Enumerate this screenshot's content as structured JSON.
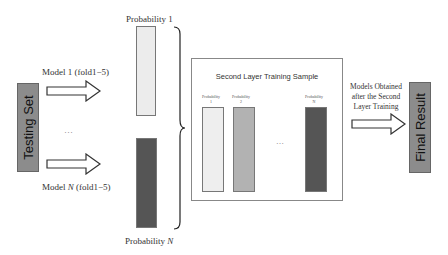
{
  "diagram": {
    "testing_set": {
      "label": "Testing Set",
      "color": "#8c8c8c"
    },
    "model_1": {
      "label": "Model 1 (fold1−5)"
    },
    "model_n": {
      "label_prefix": "Model ",
      "label_var": "N",
      "label_suffix": " (fold1−5)"
    },
    "ellipsis_models": "…",
    "probability_1": {
      "label": "Probability 1",
      "color": "#ececec"
    },
    "probability_n": {
      "label_prefix": "Probability ",
      "label_var": "N",
      "color": "#555555"
    },
    "second_layer": {
      "title": "Second Layer Training Sample",
      "columns": [
        {
          "label_top": "Probability",
          "label_bottom": "1",
          "color": "#eeeeee"
        },
        {
          "label_top": "Probability",
          "label_bottom": "2",
          "color": "#b2b2b2"
        },
        {
          "label_top": "Probability",
          "label_bottom": "N",
          "color": "#555555"
        }
      ],
      "ellipsis": "…"
    },
    "models_obtained": {
      "line1": "Models Obtained",
      "line2": "after the Second",
      "line3": "Layer Training"
    },
    "final_result": {
      "label": "Final Result",
      "color": "#8c8c8c"
    }
  }
}
